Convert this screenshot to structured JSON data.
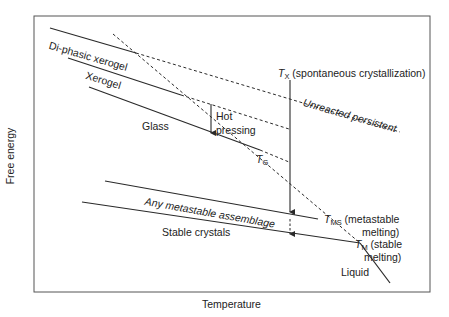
{
  "axes": {
    "y_label": "Free energy",
    "x_label": "Temperature"
  },
  "curves": {
    "diphasic_xerogel": "Di-phasic xerogel",
    "xerogel": "Xerogel",
    "glass": "Glass",
    "metastable": "Any metastable assemblage",
    "stable": "Stable crystals",
    "liquid": "Liquid",
    "unreacted": "Unreacted persistent"
  },
  "annotations": {
    "hot_pressing_1": "Hot",
    "hot_pressing_2": "pressing",
    "tg_T": "T",
    "tg_sub": "G",
    "tx_T": "T",
    "tx_sub": "X",
    "tx_desc": " (spontaneous crystallization)",
    "tms_T": "T",
    "tms_sub": "MS",
    "tms_desc1": " (metastable",
    "tms_desc2": "melting)",
    "tm_T": "T",
    "tm_sub": "M",
    "tm_desc1": " (stable",
    "tm_desc2": "melting)"
  },
  "colors": {
    "line": "#2a2a2a",
    "frame": "#555555"
  }
}
